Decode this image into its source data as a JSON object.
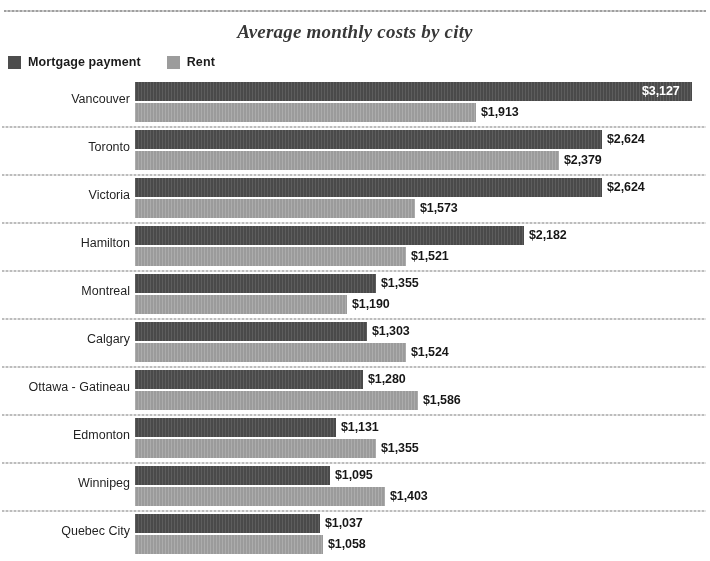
{
  "chart_data": {
    "type": "bar",
    "orientation": "horizontal",
    "title": "Average monthly costs by city",
    "xlabel": "",
    "ylabel": "",
    "grid": false,
    "legend_position": "top-left",
    "value_prefix": "$",
    "xlim": [
      0,
      3127
    ],
    "categories": [
      "Vancouver",
      "Toronto",
      "Victoria",
      "Hamilton",
      "Montreal",
      "Calgary",
      "Ottawa - Gatineau",
      "Edmonton",
      "Winnipeg",
      "Quebec City"
    ],
    "series": [
      {
        "name": "Mortgage payment",
        "color": "#4c4c4c",
        "values": [
          3127,
          2624,
          2624,
          2182,
          1355,
          1303,
          1280,
          1131,
          1095,
          1037
        ],
        "labels": [
          "$3,127",
          "$2,624",
          "$2,624",
          "$2,182",
          "$1,355",
          "$1,303",
          "$1,280",
          "$1,131",
          "$1,095",
          "$1,037"
        ]
      },
      {
        "name": "Rent",
        "color": "#9a9a9a",
        "values": [
          1913,
          2379,
          1573,
          1521,
          1190,
          1524,
          1586,
          1355,
          1403,
          1058
        ],
        "labels": [
          "$1,913",
          "$2,379",
          "$1,573",
          "$1,521",
          "$1,190",
          "$1,524",
          "$1,586",
          "$1,355",
          "$1,403",
          "$1,058"
        ]
      }
    ]
  },
  "legend": {
    "items": [
      {
        "label": "Mortgage payment",
        "color": "#4c4c4c"
      },
      {
        "label": "Rent",
        "color": "#9a9a9a"
      }
    ]
  }
}
